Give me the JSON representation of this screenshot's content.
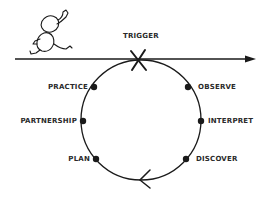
{
  "diagram": {
    "type": "cycle",
    "trigger_label": "TRIGGER",
    "stages_left": [
      {
        "label": "PRACTICE",
        "x": 94,
        "y": 87
      },
      {
        "label": "PARTNERSHIP",
        "x": 83,
        "y": 121
      },
      {
        "label": "PLAN",
        "x": 96,
        "y": 159
      }
    ],
    "stages_right": [
      {
        "label": "OBSERVE",
        "x": 188,
        "y": 87
      },
      {
        "label": "INTERPRET",
        "x": 201,
        "y": 121
      },
      {
        "label": "DISCOVER",
        "x": 186,
        "y": 159
      }
    ],
    "cycle_order": [
      "TRIGGER",
      "OBSERVE",
      "INTERPRET",
      "DISCOVER",
      "PLAN",
      "PARTNERSHIP",
      "PRACTICE"
    ],
    "colors": {
      "line": "#1a1a1a",
      "text": "#2a2a2a",
      "background": "#ffffff"
    }
  }
}
